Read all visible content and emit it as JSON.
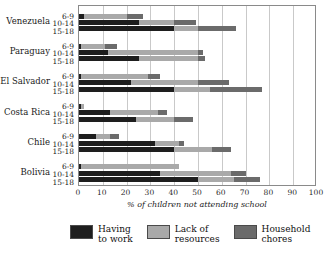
{
  "chart_data": {
    "type": "bar",
    "orientation": "horizontal",
    "stacked": true,
    "title": "",
    "xlabel": "% of children not attending school",
    "ylabel": "",
    "xlim": [
      0,
      100
    ],
    "xticks": [
      "0",
      "10",
      "20",
      "30",
      "40",
      "50",
      "60",
      "70",
      "80",
      "90",
      "100"
    ],
    "grid": true,
    "legend_position": "bottom",
    "series": [
      {
        "name": "Having to work",
        "color": "#1e1e1e"
      },
      {
        "name": "Lack of resources",
        "color": "#a9a9a9"
      },
      {
        "name": "Household chores",
        "color": "#6b6b6b"
      }
    ],
    "groups": [
      {
        "country": "Venezuela",
        "rows": [
          {
            "age": "6-9",
            "values": [
              2,
              18,
              7
            ]
          },
          {
            "age": "10-14",
            "values": [
              25,
              15,
              9
            ]
          },
          {
            "age": "15-18",
            "values": [
              40,
              10,
              16
            ]
          }
        ]
      },
      {
        "country": "Paraguay",
        "rows": [
          {
            "age": "6-9",
            "values": [
              1,
              10,
              5
            ]
          },
          {
            "age": "10-14",
            "values": [
              12,
              38,
              2
            ]
          },
          {
            "age": "15-18",
            "values": [
              25,
              25,
              3
            ]
          }
        ]
      },
      {
        "country": "El Salvador",
        "rows": [
          {
            "age": "6-9",
            "values": [
              1,
              28,
              5
            ]
          },
          {
            "age": "10-14",
            "values": [
              22,
              28,
              13
            ]
          },
          {
            "age": "15-18",
            "values": [
              40,
              15,
              22
            ]
          }
        ]
      },
      {
        "country": "Costa Rica",
        "rows": [
          {
            "age": "6-9",
            "values": [
              1,
              1,
              0
            ]
          },
          {
            "age": "10-14",
            "values": [
              13,
              20,
              4
            ]
          },
          {
            "age": "15-18",
            "values": [
              24,
              16,
              8
            ]
          }
        ]
      },
      {
        "country": "Chile",
        "rows": [
          {
            "age": "6-9",
            "values": [
              7,
              6,
              4
            ]
          },
          {
            "age": "10-14",
            "values": [
              32,
              10,
              2
            ]
          },
          {
            "age": "15-18",
            "values": [
              40,
              16,
              8
            ]
          }
        ]
      },
      {
        "country": "Bolivia",
        "rows": [
          {
            "age": "6-9",
            "values": [
              1,
              41,
              0
            ]
          },
          {
            "age": "10-14",
            "values": [
              34,
              30,
              6
            ]
          },
          {
            "age": "15-18",
            "values": [
              50,
              15,
              11
            ]
          }
        ]
      }
    ]
  },
  "legend": {
    "items": [
      {
        "label": "Having\nto work",
        "swatch_class": "sw-work"
      },
      {
        "label": "Lack of\nresources",
        "swatch_class": "sw-res"
      },
      {
        "label": "Household\nchores",
        "swatch_class": "sw-chore"
      }
    ]
  }
}
